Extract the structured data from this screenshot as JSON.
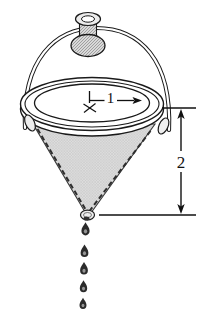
{
  "figure": {
    "labels": {
      "radius": "1",
      "depth": "2"
    },
    "drops": {
      "count": 5
    },
    "colors": {
      "ink": "#1a1a1a",
      "cone_fill": "#dedede",
      "mesh_line": "#c0c0c0",
      "knob_fill": "#d9d9d9",
      "knob_hatch": "#909090",
      "drop_fill": "#2b2b2b",
      "background": "#ffffff"
    }
  }
}
